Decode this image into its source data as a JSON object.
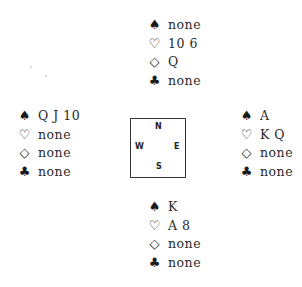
{
  "suit_symbols": {
    "spades": "♠",
    "hearts": "♡",
    "diamonds": "◇",
    "clubs": "♣"
  },
  "hands": {
    "north": {
      "spades": "none",
      "hearts": "10 6",
      "diamonds": "Q",
      "clubs": "none"
    },
    "west": {
      "spades": "Q J 10",
      "hearts": "none",
      "diamonds": "none",
      "clubs": "none"
    },
    "east": {
      "spades": "A",
      "hearts": "K Q",
      "diamonds": "none",
      "clubs": "none"
    },
    "south": {
      "spades": "K",
      "hearts": "A 8",
      "diamonds": "none",
      "clubs": "none"
    }
  },
  "compass": {
    "north": "N",
    "south": "S",
    "east": "E",
    "west": "W"
  }
}
